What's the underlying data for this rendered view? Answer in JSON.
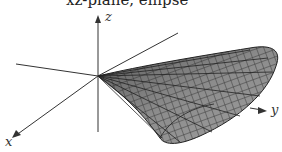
{
  "caption": "xz-plane, ellipse",
  "figure": {
    "axes": {
      "x": "x",
      "y": "y",
      "z": "z"
    },
    "colors": {
      "surface": "#8a8a8a",
      "grid": "#2a2a2a",
      "axis": "#333333"
    }
  }
}
